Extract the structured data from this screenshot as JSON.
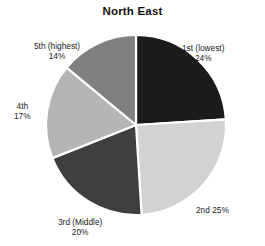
{
  "chart_data": {
    "type": "pie",
    "title": "North East",
    "xlabel": "",
    "ylabel": "",
    "legend": "none",
    "grid": false,
    "start_angle_deg": 0,
    "direction": "clockwise",
    "categories": [
      "1st (lowest)",
      "2nd",
      "3rd (Middle)",
      "4th",
      "5th (highest)"
    ],
    "values": [
      24,
      25,
      20,
      17,
      14
    ],
    "value_suffix": "%",
    "colors": [
      "#1b1b1b",
      "#d2d2d2",
      "#3f3f3f",
      "#b5b5b5",
      "#808080"
    ],
    "slice_separator_color": "#ffffff",
    "labels": [
      {
        "name": "1st (lowest)",
        "value": "24%",
        "layout": "stacked",
        "align": "center"
      },
      {
        "name": "2nd",
        "value": "25%",
        "layout": "inline",
        "align": "left"
      },
      {
        "name": "3rd (Middle)",
        "value": "20%",
        "layout": "stacked",
        "align": "center"
      },
      {
        "name": "4th",
        "value": "17%",
        "layout": "stacked",
        "align": "center"
      },
      {
        "name": "5th (highest)",
        "value": "14%",
        "layout": "stacked",
        "align": "center"
      }
    ]
  },
  "chart": {
    "title": "North East"
  }
}
